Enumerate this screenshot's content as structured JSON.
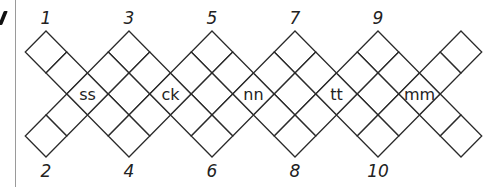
{
  "worksheet": {
    "colors": {
      "line": "#2a2a2a",
      "text": "#222222",
      "margin": "#9a9a9a",
      "background": "#ffffff"
    },
    "grid": {
      "origin_x": 46,
      "origin_y": 31,
      "step_x": 20.75,
      "step_y": 21
    },
    "top_labels": [
      {
        "text": "1",
        "p": 0
      },
      {
        "text": "3",
        "p": 4
      },
      {
        "text": "5",
        "p": 8
      },
      {
        "text": "7",
        "p": 12
      },
      {
        "text": "9",
        "p": 16
      }
    ],
    "bottom_labels": [
      {
        "text": "2",
        "p": 0
      },
      {
        "text": "4",
        "p": 4
      },
      {
        "text": "6",
        "p": 8
      },
      {
        "text": "8",
        "p": 12
      },
      {
        "text": "10",
        "p": 16
      }
    ],
    "letter_pairs": [
      {
        "text": "ss",
        "p": 2,
        "q": 3
      },
      {
        "text": "ck",
        "p": 6,
        "q": 3
      },
      {
        "text": "nn",
        "p": 10,
        "q": 3
      },
      {
        "text": "tt",
        "p": 14,
        "q": 3
      },
      {
        "text": "mm",
        "p": 18,
        "q": 3
      }
    ],
    "cells": [
      [
        0,
        1
      ],
      [
        1,
        2
      ],
      [
        2,
        3
      ],
      [
        1,
        4
      ],
      [
        0,
        5
      ],
      [
        4,
        1
      ],
      [
        3,
        2
      ],
      [
        5,
        2
      ],
      [
        4,
        3
      ],
      [
        6,
        3
      ],
      [
        3,
        4
      ],
      [
        5,
        4
      ],
      [
        4,
        5
      ],
      [
        8,
        1
      ],
      [
        7,
        2
      ],
      [
        9,
        2
      ],
      [
        8,
        3
      ],
      [
        10,
        3
      ],
      [
        7,
        4
      ],
      [
        9,
        4
      ],
      [
        8,
        5
      ],
      [
        12,
        1
      ],
      [
        11,
        2
      ],
      [
        13,
        2
      ],
      [
        12,
        3
      ],
      [
        14,
        3
      ],
      [
        11,
        4
      ],
      [
        13,
        4
      ],
      [
        12,
        5
      ],
      [
        16,
        1
      ],
      [
        15,
        2
      ],
      [
        17,
        2
      ],
      [
        16,
        3
      ],
      [
        18,
        3
      ],
      [
        15,
        4
      ],
      [
        17,
        4
      ],
      [
        16,
        5
      ],
      [
        19,
        2
      ],
      [
        20,
        1
      ],
      [
        19,
        4
      ],
      [
        20,
        5
      ]
    ]
  }
}
